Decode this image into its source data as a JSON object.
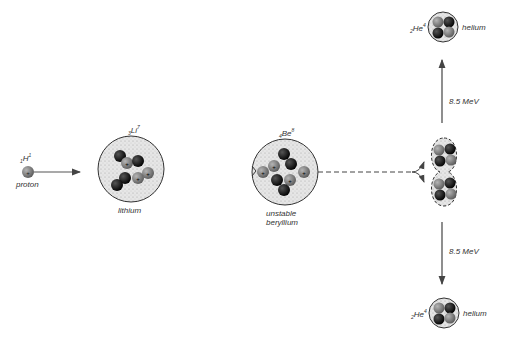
{
  "diagram": {
    "proton": {
      "symbol": "H",
      "mass": "1",
      "atomic": "1",
      "label": "proton"
    },
    "lithium": {
      "symbol": "Li",
      "mass": "7",
      "atomic": "3",
      "label": "lithium"
    },
    "beryllium": {
      "symbol": "Be",
      "mass": "8",
      "atomic": "4",
      "label_line1": "unstable",
      "label_line2": "beryllium"
    },
    "helium_top": {
      "symbol": "He",
      "mass": "4",
      "atomic": "2",
      "label": "helium"
    },
    "helium_bottom": {
      "symbol": "He",
      "mass": "4",
      "atomic": "2",
      "label": "helium"
    },
    "energy_top": "8.5 MeV",
    "energy_bottom": "8.5 MeV",
    "colors": {
      "proton": "#7a7a7a",
      "neutron": "#151515",
      "nucleus_fill": "#e2e2e2",
      "line": "#444444"
    }
  }
}
